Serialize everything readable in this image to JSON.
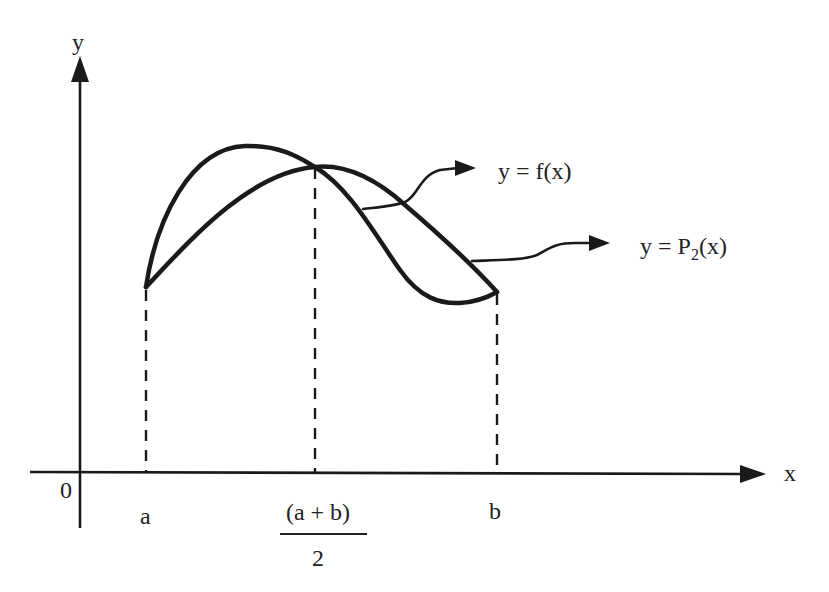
{
  "diagram": {
    "axes": {
      "x_label": "x",
      "y_label": "y",
      "origin_label": "0"
    },
    "ticks": {
      "a": "a",
      "b": "b",
      "mid_numerator": "(a + b)",
      "mid_denominator": "2"
    },
    "curves": [
      {
        "name": "f",
        "label_prefix": "y = f(x)"
      },
      {
        "name": "P2",
        "label_y": "y = P",
        "label_sub": "2",
        "label_suffix": "(x)"
      }
    ],
    "colors": {
      "ink": "#1a1a1a",
      "background": "#ffffff"
    }
  }
}
